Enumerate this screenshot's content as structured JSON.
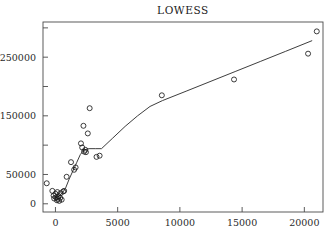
{
  "chart_data": {
    "type": "scatter",
    "title": "LOWESS",
    "xlabel": "",
    "ylabel": "",
    "xlim": [
      -1000,
      21500
    ],
    "ylim": [
      -14000,
      310000
    ],
    "grid": false,
    "legend": null,
    "marker": "open-circle",
    "xticks": [
      0,
      5000,
      10000,
      15000,
      20000
    ],
    "xticklabels": [
      "0",
      "5000",
      "10000",
      "15000",
      "20000"
    ],
    "yticks": [
      0,
      50000,
      100000,
      150000,
      200000,
      250000,
      300000
    ],
    "yticklabels": [
      "0",
      "50000",
      "",
      "150000",
      "",
      "250000",
      ""
    ],
    "colors": {
      "axis": "#4a4a4a",
      "marker": "#1a1a1a",
      "line": "#333333",
      "text": "#2b2b2b",
      "background": "#ffffff"
    },
    "points": [
      {
        "x": -700,
        "y": 35000
      },
      {
        "x": -250,
        "y": 22000
      },
      {
        "x": -150,
        "y": 14000
      },
      {
        "x": -100,
        "y": 9000
      },
      {
        "x": 0,
        "y": 17000
      },
      {
        "x": 60,
        "y": 11000
      },
      {
        "x": 120,
        "y": 6000
      },
      {
        "x": 150,
        "y": 20000
      },
      {
        "x": 200,
        "y": 8500
      },
      {
        "x": 250,
        "y": 13000
      },
      {
        "x": 300,
        "y": 5000
      },
      {
        "x": 380,
        "y": 10000
      },
      {
        "x": 420,
        "y": 18000
      },
      {
        "x": 500,
        "y": 7000
      },
      {
        "x": 620,
        "y": 21000
      },
      {
        "x": 700,
        "y": 22000
      },
      {
        "x": 900,
        "y": 46000
      },
      {
        "x": 1250,
        "y": 71000
      },
      {
        "x": 1500,
        "y": 58000
      },
      {
        "x": 1620,
        "y": 62000
      },
      {
        "x": 2050,
        "y": 103000
      },
      {
        "x": 2150,
        "y": 96000
      },
      {
        "x": 2250,
        "y": 133000
      },
      {
        "x": 2300,
        "y": 89000
      },
      {
        "x": 2400,
        "y": 92000
      },
      {
        "x": 2450,
        "y": 88000
      },
      {
        "x": 2600,
        "y": 120000
      },
      {
        "x": 2750,
        "y": 163000
      },
      {
        "x": 3300,
        "y": 80000
      },
      {
        "x": 3550,
        "y": 82000
      },
      {
        "x": 8550,
        "y": 185000
      },
      {
        "x": 14350,
        "y": 212000
      },
      {
        "x": 20300,
        "y": 256000
      },
      {
        "x": 21000,
        "y": 294000
      }
    ],
    "lowess_curve": [
      {
        "x": -150,
        "y": 9000
      },
      {
        "x": 200,
        "y": 12000
      },
      {
        "x": 500,
        "y": 17000
      },
      {
        "x": 800,
        "y": 26000
      },
      {
        "x": 1100,
        "y": 42000
      },
      {
        "x": 1400,
        "y": 56000
      },
      {
        "x": 1700,
        "y": 70000
      },
      {
        "x": 2000,
        "y": 84000
      },
      {
        "x": 2300,
        "y": 92000
      },
      {
        "x": 2700,
        "y": 94000
      },
      {
        "x": 3200,
        "y": 94000
      },
      {
        "x": 3700,
        "y": 94000
      },
      {
        "x": 4600,
        "y": 112000
      },
      {
        "x": 5600,
        "y": 132000
      },
      {
        "x": 6600,
        "y": 150000
      },
      {
        "x": 7600,
        "y": 166000
      },
      {
        "x": 8600,
        "y": 176000
      },
      {
        "x": 10500,
        "y": 192000
      },
      {
        "x": 12500,
        "y": 209000
      },
      {
        "x": 14500,
        "y": 226000
      },
      {
        "x": 16500,
        "y": 243000
      },
      {
        "x": 18500,
        "y": 260000
      },
      {
        "x": 20600,
        "y": 278000
      }
    ]
  }
}
